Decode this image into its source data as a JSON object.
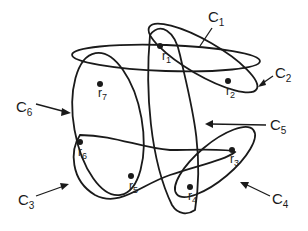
{
  "diagram": {
    "type": "hypergraph / overlapping sets",
    "points": [
      {
        "id": "r1",
        "base": "r",
        "sub": "1"
      },
      {
        "id": "r2",
        "base": "r",
        "sub": "2"
      },
      {
        "id": "r3",
        "base": "r",
        "sub": "3"
      },
      {
        "id": "r4",
        "base": "r",
        "sub": "4"
      },
      {
        "id": "r5",
        "base": "r",
        "sub": "5"
      },
      {
        "id": "r6",
        "base": "r",
        "sub": "6"
      },
      {
        "id": "r7",
        "base": "r",
        "sub": "7"
      }
    ],
    "curves": [
      {
        "id": "C1",
        "base": "C",
        "sub": "1",
        "contains": [
          "r1",
          "r2"
        ]
      },
      {
        "id": "C2",
        "base": "C",
        "sub": "2",
        "contains": [
          "r2",
          "r7"
        ]
      },
      {
        "id": "C3",
        "base": "C",
        "sub": "3",
        "contains": [
          "r5",
          "r6",
          "r4"
        ]
      },
      {
        "id": "C4",
        "base": "C",
        "sub": "4",
        "contains": [
          "r3",
          "r4"
        ]
      },
      {
        "id": "C5",
        "base": "C",
        "sub": "5",
        "contains": [
          "r1",
          "r4"
        ]
      },
      {
        "id": "C6",
        "base": "C",
        "sub": "6",
        "contains": [
          "r5",
          "r6",
          "r7"
        ]
      }
    ]
  }
}
